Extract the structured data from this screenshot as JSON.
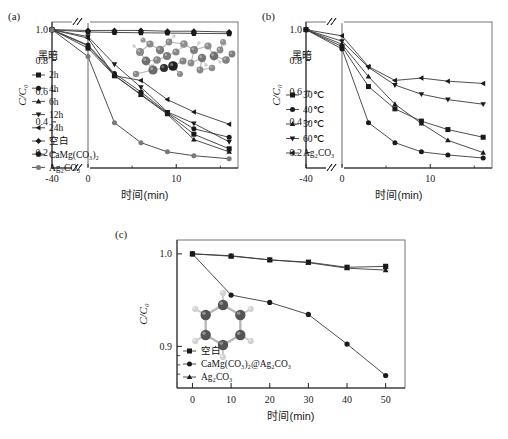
{
  "figure": {
    "panels": [
      {
        "tag": "(a)",
        "label_cn_dark": "黑暗",
        "xlabel": "时间(min)",
        "ylabel": "C/C₀"
      },
      {
        "tag": "(b)",
        "label_cn_dark": "黑暗",
        "xlabel": "时间(min)",
        "ylabel": "C/C₀"
      },
      {
        "tag": "(c)",
        "label_cn_dark": "",
        "xlabel": "时间(min)",
        "ylabel": "C/C₀"
      }
    ]
  },
  "chart_data": [
    {
      "type": "line",
      "panel": "(a)",
      "title": "",
      "xlabel": "时间(min)",
      "ylabel": "C/C₀",
      "xlim": [
        -40,
        17
      ],
      "ylim": [
        0.1,
        1.05
      ],
      "xticks": [
        -40,
        0,
        10
      ],
      "xticklabels": [
        "-40",
        "0",
        "10"
      ],
      "yticks": [
        0.2,
        0.4,
        0.6,
        0.8,
        1.0
      ],
      "yticklabels": [
        "0.2",
        "0.4",
        "0.6",
        "0.8",
        "1.0"
      ],
      "axis_break_x": true,
      "dark_region_label": "黑暗",
      "grid": false,
      "legend_position": "left-inside",
      "inset": "molecular-model-cluster",
      "series": [
        {
          "name": "2h",
          "marker": "square",
          "x": [
            -40,
            0,
            3,
            6,
            9,
            12,
            16
          ],
          "y": [
            1.0,
            0.88,
            0.7,
            0.58,
            0.455,
            0.32,
            0.225
          ]
        },
        {
          "name": "4h",
          "marker": "circle",
          "x": [
            -40,
            0,
            3,
            6,
            9,
            12,
            16
          ],
          "y": [
            1.0,
            0.9,
            0.715,
            0.595,
            0.46,
            0.355,
            0.3
          ]
        },
        {
          "name": "6h",
          "marker": "triangle-up",
          "x": [
            -40,
            0,
            3,
            6,
            9,
            12,
            16
          ],
          "y": [
            1.0,
            0.895,
            0.705,
            0.575,
            0.45,
            0.285,
            0.205
          ]
        },
        {
          "name": "12h",
          "marker": "triangle-down",
          "x": [
            -40,
            0,
            3,
            6,
            9,
            12,
            16
          ],
          "y": [
            1.0,
            0.955,
            0.775,
            0.625,
            0.465,
            0.39,
            0.27
          ]
        },
        {
          "name": "24h",
          "marker": "triangle-left",
          "x": [
            -40,
            0,
            3,
            6,
            9,
            12,
            16
          ],
          "y": [
            1.0,
            0.945,
            0.7,
            0.67,
            0.545,
            0.465,
            0.385
          ]
        },
        {
          "name": "空白",
          "marker": "diamond",
          "x": [
            -40,
            0,
            3,
            6,
            9,
            12,
            16
          ],
          "y": [
            1.0,
            0.995,
            0.995,
            0.995,
            0.99,
            0.99,
            0.985
          ]
        },
        {
          "name": "CaMg(CO₃)₂",
          "marker": "pentagon",
          "x": [
            -40,
            0,
            3,
            6,
            9,
            12,
            16
          ],
          "y": [
            1.0,
            0.985,
            0.982,
            0.98,
            0.978,
            0.976,
            0.974
          ]
        },
        {
          "name": "Ag₂CO₃",
          "marker": "circle-gray",
          "x": [
            -40,
            0,
            3,
            6,
            9,
            12,
            16
          ],
          "y": [
            1.0,
            0.825,
            0.395,
            0.265,
            0.205,
            0.18,
            0.16
          ]
        }
      ]
    },
    {
      "type": "line",
      "panel": "(b)",
      "title": "",
      "xlabel": "时间(min)",
      "ylabel": "C/C₀",
      "xlim": [
        -40,
        17
      ],
      "ylim": [
        0.1,
        1.05
      ],
      "xticks": [
        -40,
        0,
        10
      ],
      "xticklabels": [
        "-40",
        "0",
        "10"
      ],
      "yticks": [
        0.2,
        0.4,
        0.6,
        0.8,
        1.0
      ],
      "yticklabels": [
        "0.2",
        "0.4",
        "0.6",
        "0.8",
        "1.0"
      ],
      "axis_break_x": true,
      "dark_region_label": "黑暗",
      "grid": false,
      "legend_position": "left-inside",
      "series": [
        {
          "name": "30℃",
          "marker": "square",
          "x": [
            -40,
            0,
            3,
            6,
            9,
            12,
            16
          ],
          "y": [
            1.0,
            0.89,
            0.63,
            0.485,
            0.405,
            0.35,
            0.3
          ]
        },
        {
          "name": "40℃",
          "marker": "circle",
          "x": [
            -40,
            0,
            3,
            6,
            9,
            12,
            16
          ],
          "y": [
            1.0,
            0.875,
            0.395,
            0.265,
            0.205,
            0.185,
            0.165
          ]
        },
        {
          "name": "50℃",
          "marker": "triangle-up",
          "x": [
            -40,
            0,
            3,
            6,
            9,
            12,
            16
          ],
          "y": [
            1.0,
            0.905,
            0.695,
            0.515,
            0.39,
            0.28,
            0.2
          ]
        },
        {
          "name": "60℃",
          "marker": "triangle-down",
          "x": [
            -40,
            0,
            3,
            6,
            9,
            12,
            16
          ],
          "y": [
            1.0,
            0.925,
            0.755,
            0.64,
            0.58,
            0.545,
            0.515
          ]
        },
        {
          "name": "Ag₂CO₃",
          "marker": "triangle-left",
          "x": [
            -40,
            0,
            3,
            6,
            9,
            12,
            16
          ],
          "y": [
            1.0,
            0.96,
            0.76,
            0.67,
            0.685,
            0.665,
            0.65
          ]
        }
      ]
    },
    {
      "type": "line",
      "panel": "(c)",
      "title": "",
      "xlabel": "时间(min)",
      "ylabel": "C/C₀",
      "xlim": [
        -4,
        55
      ],
      "ylim": [
        0.855,
        1.015
      ],
      "xticks": [
        0,
        10,
        20,
        30,
        40,
        50
      ],
      "xticklabels": [
        "0",
        "10",
        "20",
        "30",
        "40",
        "50"
      ],
      "yticks": [
        0.9,
        1.0
      ],
      "yticklabels": [
        "0.9",
        "1.0"
      ],
      "yminorticks": [
        0.87,
        0.88,
        0.89
      ],
      "axis_break_x": false,
      "grid": false,
      "legend_position": "bottom-left-inside",
      "inset": "benzene-ring-model",
      "series": [
        {
          "name": "空白",
          "marker": "square",
          "x": [
            0,
            10,
            20,
            30,
            40,
            50
          ],
          "y": [
            1.0,
            0.9975,
            0.9935,
            0.991,
            0.9855,
            0.9865
          ]
        },
        {
          "name": "CaMg(CO₃)₂@Ag₂CO₃",
          "marker": "circle",
          "x": [
            0,
            10,
            20,
            30,
            40,
            50
          ],
          "y": [
            1.0,
            0.9555,
            0.9475,
            0.9345,
            0.9025,
            0.8685
          ]
        },
        {
          "name": "Ag₂CO₃",
          "marker": "triangle-up",
          "x": [
            0,
            10,
            20,
            30,
            40,
            50
          ],
          "y": [
            1.0,
            0.998,
            0.9935,
            0.9905,
            0.9845,
            0.9825
          ]
        }
      ]
    }
  ],
  "panel_a": {
    "tag": "(a)",
    "dark": "黑暗",
    "xlabel": "时间(min)",
    "ylabel": "C/C₀",
    "xticklabels": [
      "-40",
      "0",
      "10"
    ],
    "yticklabels": [
      "0.2",
      "0.4",
      "0.6",
      "0.8",
      "1.0"
    ],
    "legend": [
      "2h",
      "4h",
      "6h",
      "12h",
      "24h",
      "空白",
      "CaMg(CO₃)₂",
      "Ag₂CO₃"
    ]
  },
  "panel_b": {
    "tag": "(b)",
    "dark": "黑暗",
    "xlabel": "时间(min)",
    "ylabel": "C/C₀",
    "xticklabels": [
      "-40",
      "0",
      "10"
    ],
    "yticklabels": [
      "0.2",
      "0.4",
      "0.6",
      "0.8",
      "1.0"
    ],
    "legend": [
      "30℃",
      "40℃",
      "50℃",
      "60℃",
      "Ag₂CO₃"
    ]
  },
  "panel_c": {
    "tag": "(c)",
    "xlabel": "时间(min)",
    "ylabel": "C/C₀",
    "xticklabels": [
      "0",
      "10",
      "20",
      "30",
      "40",
      "50"
    ],
    "yticklabels": [
      "1.0",
      "0.9"
    ],
    "legend": [
      "空白",
      "CaMg(CO₃)₂@Ag₂CO₃",
      "Ag₂CO₃"
    ]
  },
  "colors": {
    "line": "#3a3a3a",
    "marker_dark": "#1a1a1a",
    "marker_gray": "#7a7a7a",
    "frame": "#666666",
    "text": "#1a1a1a"
  }
}
